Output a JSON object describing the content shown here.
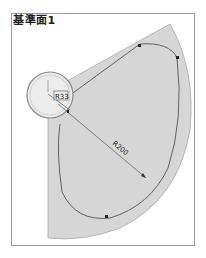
{
  "title": "基準面1",
  "dimensions": {
    "small_radius": "R33",
    "large_radius": "R200"
  },
  "colors": {
    "sector_fill": "#d4d4d4",
    "circle_fill": "#e8e8e8",
    "outline": "#6a6a6a",
    "frame": "#9a9a9a"
  }
}
